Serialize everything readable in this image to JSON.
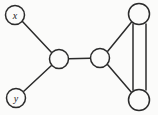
{
  "figure": {
    "name": "undirected-multigraph",
    "width": 158,
    "height": 115,
    "background_color": "#fbfbfa",
    "stroke_color": "#2b2b2b",
    "node_fill_color": "#fbfbfa",
    "label_color": "#1d1d1d"
  },
  "nodes": [
    {
      "id": "x",
      "label": "x",
      "cx": 15,
      "cy": 15,
      "r": 9.5,
      "labeled": true
    },
    {
      "id": "y",
      "label": "y",
      "cx": 16,
      "cy": 98,
      "r": 9.5,
      "labeled": true
    },
    {
      "id": "left-middle",
      "label": "",
      "cx": 59,
      "cy": 59,
      "r": 9.5,
      "labeled": false
    },
    {
      "id": "right-middle",
      "label": "",
      "cx": 100,
      "cy": 58,
      "r": 9.5,
      "labeled": false
    },
    {
      "id": "top-right",
      "label": "",
      "cx": 139,
      "cy": 14,
      "r": 10.5,
      "labeled": false
    },
    {
      "id": "bottom-right",
      "label": "",
      "cx": 139,
      "cy": 100,
      "r": 10.5,
      "labeled": false
    }
  ],
  "edges": [
    {
      "id": "edge-x-leftmiddle",
      "from": "x",
      "to": "left-middle",
      "multiplicity": 1,
      "x1": 22,
      "y1": 21,
      "x2": 52,
      "y2": 53
    },
    {
      "id": "edge-y-leftmiddle",
      "from": "y",
      "to": "left-middle",
      "multiplicity": 1,
      "x1": 23,
      "y1": 92,
      "x2": 52,
      "y2": 65
    },
    {
      "id": "edge-leftmiddle-rightmiddle",
      "from": "left-middle",
      "to": "right-middle",
      "multiplicity": 1,
      "x1": 68.5,
      "y1": 58.8,
      "x2": 90.5,
      "y2": 58.2
    },
    {
      "id": "edge-rightmiddle-topright",
      "from": "right-middle",
      "to": "top-right",
      "multiplicity": 1,
      "x1": 107.5,
      "y1": 51.5,
      "x2": 132,
      "y2": 21.5
    },
    {
      "id": "edge-rightmiddle-bottomright",
      "from": "right-middle",
      "to": "bottom-right",
      "multiplicity": 1,
      "x1": 107.5,
      "y1": 64.5,
      "x2": 132,
      "y2": 93
    },
    {
      "id": "edge-topright-bottomright-a",
      "from": "top-right",
      "to": "bottom-right",
      "multiplicity": 2,
      "x1": 133,
      "y1": 24,
      "x2": 133,
      "y2": 90
    },
    {
      "id": "edge-topright-bottomright-b",
      "from": "top-right",
      "to": "bottom-right",
      "multiplicity": 2,
      "x1": 146,
      "y1": 24,
      "x2": 146,
      "y2": 90
    }
  ]
}
